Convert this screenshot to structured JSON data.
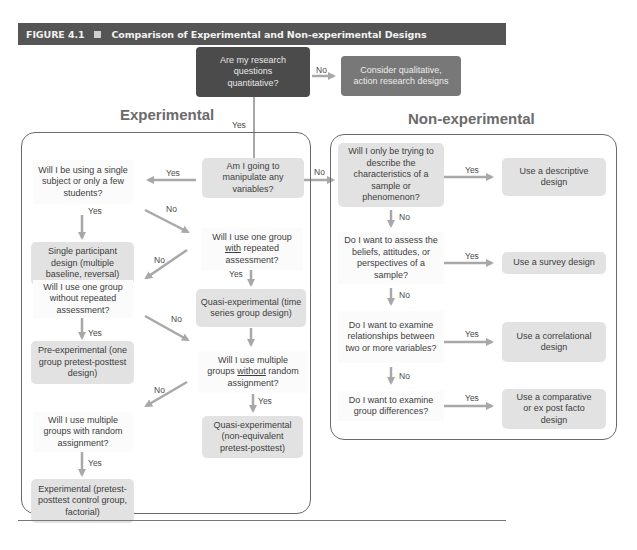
{
  "header": {
    "figure_label": "FIGURE 4.1",
    "title": "Comparison of Experimental and Non-experimental Designs"
  },
  "top": {
    "start_question": "Are my research questions quantitative?",
    "no_label": "No",
    "qualitative_outcome": "Consider qualitative, action research designs",
    "yes_label": "Yes"
  },
  "experimental": {
    "title": "Experimental",
    "manipulate_question": "Am I going to manipulate any variables?",
    "single_subject_question": "Will I be using a single subject or only a few students?",
    "single_participant_outcome": "Single participant design (multiple baseline, reversal)",
    "one_group_repeated_question_pre": "Will I use one group",
    "one_group_repeated_question_underlined": "with",
    "one_group_repeated_question_post": "repeated assessment?",
    "time_series_outcome": "Quasi-experimental (time series group design)",
    "one_group_without_question": "Will I use one group without repeated assessment?",
    "pre_experimental_outcome": "Pre-experimental (one group pretest-posttest design)",
    "multiple_without_question_pre": "Will I use multiple groups",
    "multiple_without_question_underlined": "without",
    "multiple_without_question_post": "random assignment?",
    "nonequivalent_outcome": "Quasi-experimental (non-equivalent pretest-posttest)",
    "multiple_random_question": "Will I use multiple groups with random assignment?",
    "experimental_outcome": "Experimental (pretest-posttest control group, factorial)",
    "labels": {
      "yes_to_single": "Yes",
      "yes_single_down": "Yes",
      "no_single_to_one_group": "No",
      "yes_one_group_down": "Yes",
      "no_one_group_to_without": "No",
      "no_without_to_multiple": "No",
      "yes_without_down": "Yes",
      "no_multiple_to_random": "No",
      "yes_multiple_down": "Yes",
      "yes_random_down": "Yes",
      "no_to_nonexperimental": "No"
    }
  },
  "nonexperimental": {
    "title": "Non-experimental",
    "describe_question": "Will I only be trying to describe the characteristics of a sample or phenomenon?",
    "descriptive_outcome": "Use a descriptive design",
    "beliefs_question": "Do I want to assess the beliefs, attitudes, or perspectives of a sample?",
    "survey_outcome": "Use a survey design",
    "relationships_question": "Do I want to examine relationships between two or more variables?",
    "correlational_outcome": "Use a correlational design",
    "differences_question": "Do I want to examine group differences?",
    "comparative_outcome": "Use a comparative or ex post facto design",
    "labels": {
      "yes_descriptive": "Yes",
      "no_1": "No",
      "yes_survey": "Yes",
      "no_2": "No",
      "yes_correlational": "Yes",
      "no_3": "No",
      "yes_comparative": "Yes"
    }
  },
  "colors": {
    "header_bg": "#555555",
    "dark_box": "#4b4b4b",
    "mid_box": "#787878",
    "outcome_box": "#e2e2e2",
    "arrow": "#a8a8a8",
    "panel_border": "#6a6a6a"
  }
}
